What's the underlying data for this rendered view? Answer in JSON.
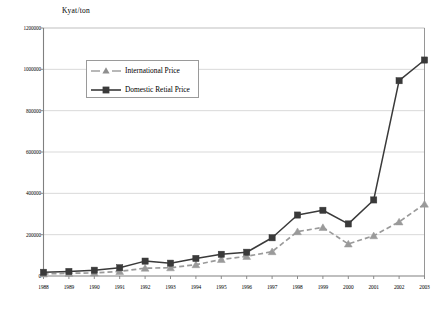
{
  "chart_data": {
    "type": "line",
    "title": "",
    "xlabel": "",
    "ylabel": "Kyat/ton",
    "ylim": [
      0,
      1200000
    ],
    "ytick_values": [
      0,
      200000,
      400000,
      600000,
      800000,
      1000000,
      1200000
    ],
    "ytick_labels": [
      "0",
      "200000",
      "400000",
      "600000",
      "800000",
      "1000000",
      "1200000"
    ],
    "grid": true,
    "legend_position": "upper-left-inside",
    "categories": [
      "1988",
      "1989",
      "1990",
      "1991",
      "1992",
      "1993",
      "1994",
      "1995",
      "1996",
      "1997",
      "1998",
      "1999",
      "2000",
      "2001",
      "2002",
      "2003"
    ],
    "series": [
      {
        "name": "International Price",
        "color": "#9a9a9a",
        "marker": "triangle",
        "linestyle": "dashed",
        "values": [
          10000,
          13000,
          15000,
          22000,
          38000,
          40000,
          55000,
          80000,
          95000,
          118000,
          215000,
          235000,
          155000,
          195000,
          262000,
          348000
        ]
      },
      {
        "name": "Domestic Retial Price",
        "color": "#3a3a3a",
        "marker": "square",
        "linestyle": "solid",
        "values": [
          18000,
          22000,
          28000,
          40000,
          72000,
          62000,
          85000,
          105000,
          115000,
          185000,
          295000,
          318000,
          252000,
          368000,
          945000,
          1045000
        ]
      }
    ]
  },
  "legend": {
    "items": [
      {
        "label": "International Price"
      },
      {
        "label": "Domestic Retial Price"
      }
    ]
  },
  "colors": {
    "axis": "#808080",
    "grid": "#c8c8c8",
    "series_international": "#9a9a9a",
    "series_domestic": "#3a3a3a",
    "background": "#ffffff"
  }
}
